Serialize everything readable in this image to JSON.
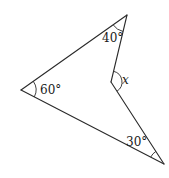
{
  "diagram": {
    "type": "concave-quadrilateral",
    "vertices": {
      "top": {
        "x": 127,
        "y": 15
      },
      "left": {
        "x": 21,
        "y": 90
      },
      "inner": {
        "x": 111,
        "y": 82
      },
      "bottom_right": {
        "x": 164,
        "y": 164
      }
    },
    "angles": {
      "top": {
        "label": "40°"
      },
      "left": {
        "label": "60°"
      },
      "inner": {
        "label": "x"
      },
      "bottom_right": {
        "label": "30°"
      }
    },
    "colors": {
      "line": "#2a2a2a",
      "text": "#1a1a1a",
      "background": "#ffffff"
    }
  }
}
